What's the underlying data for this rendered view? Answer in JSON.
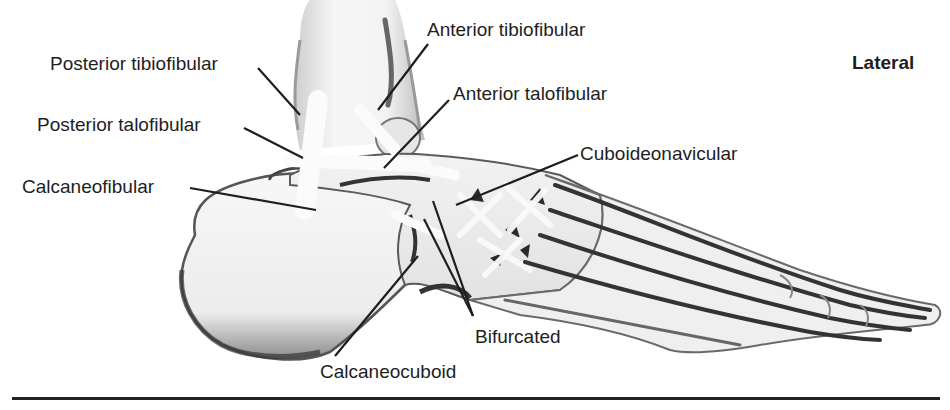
{
  "figure": {
    "view": "Lateral",
    "labels": [
      {
        "id": "posterior-tibiofibular",
        "text": "Posterior tibiofibular",
        "x": 50,
        "y": 54
      },
      {
        "id": "anterior-tibiofibular",
        "text": "Anterior tibiofibular",
        "x": 427,
        "y": 20
      },
      {
        "id": "anterior-talofibular",
        "text": "Anterior talofibular",
        "x": 453,
        "y": 84
      },
      {
        "id": "posterior-talofibular",
        "text": "Posterior talofibular",
        "x": 37,
        "y": 115
      },
      {
        "id": "cuboideonavicular",
        "text": "Cuboideonavicular",
        "x": 580,
        "y": 144
      },
      {
        "id": "calcaneofibular",
        "text": "Calcaneofibular",
        "x": 22,
        "y": 177
      },
      {
        "id": "bifurcated",
        "text": "Bifurcated",
        "x": 475,
        "y": 327
      },
      {
        "id": "calcaneocuboid",
        "text": "Calcaneocuboid",
        "x": 320,
        "y": 362
      }
    ],
    "colors": {
      "ink": "#1e1e1e",
      "bone_fill": "#f4f4f4",
      "shadow": "#555555",
      "rule": "#222222"
    }
  }
}
